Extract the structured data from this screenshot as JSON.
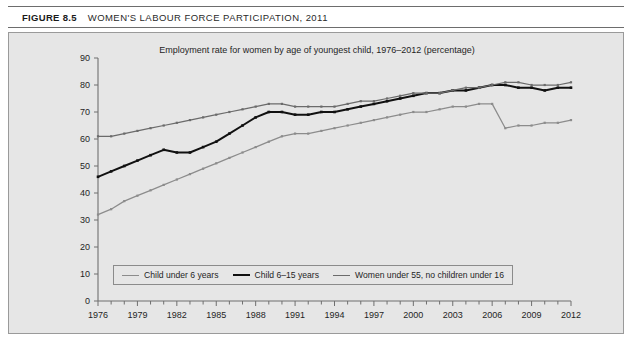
{
  "figure": {
    "number": "FIGURE 8.5",
    "title": "WOMEN'S LABOUR FORCE PARTICIPATION, 2011"
  },
  "chart_data": {
    "type": "line",
    "title": "Employment rate for women by age of youngest child, 1976–2012 (percentage)",
    "xlabel": "",
    "ylabel": "",
    "xlim": [
      1976,
      2012
    ],
    "ylim": [
      0,
      90
    ],
    "yticks": [
      0,
      10,
      20,
      30,
      40,
      50,
      60,
      70,
      80,
      90
    ],
    "xticks_labeled": [
      1976,
      1979,
      1982,
      1985,
      1988,
      1991,
      1994,
      1997,
      2000,
      2003,
      2006,
      2009,
      2012
    ],
    "xtick_interval_minor": 1,
    "grid": false,
    "legend_position": "inside-bottom-left",
    "markers": "square",
    "x": [
      1976,
      1977,
      1978,
      1979,
      1980,
      1981,
      1982,
      1983,
      1984,
      1985,
      1986,
      1987,
      1988,
      1989,
      1990,
      1991,
      1992,
      1993,
      1994,
      1995,
      1996,
      1997,
      1998,
      1999,
      2000,
      2001,
      2002,
      2003,
      2004,
      2005,
      2006,
      2007,
      2008,
      2009,
      2010,
      2011,
      2012
    ],
    "series": [
      {
        "name": "Child under 6 years",
        "color": "#8c8c8c",
        "values": [
          32,
          34,
          37,
          39,
          41,
          43,
          45,
          47,
          49,
          51,
          53,
          55,
          57,
          59,
          61,
          62,
          62,
          63,
          64,
          65,
          66,
          67,
          68,
          69,
          70,
          70,
          71,
          72,
          72,
          73,
          73,
          64,
          65,
          65,
          66,
          66,
          67
        ]
      },
      {
        "name": "Child 6–15 years",
        "color": "#111111",
        "values": [
          46,
          48,
          50,
          52,
          54,
          56,
          55,
          55,
          57,
          59,
          62,
          65,
          68,
          70,
          70,
          69,
          69,
          70,
          70,
          71,
          72,
          73,
          74,
          75,
          76,
          77,
          77,
          78,
          78,
          79,
          80,
          80,
          79,
          79,
          78,
          79,
          79
        ]
      },
      {
        "name": "Women under 55, no children under 16",
        "color": "#6b6b6b",
        "values": [
          61,
          61,
          62,
          63,
          64,
          65,
          66,
          67,
          68,
          69,
          70,
          71,
          72,
          73,
          73,
          72,
          72,
          72,
          72,
          73,
          74,
          74,
          75,
          76,
          77,
          77,
          77,
          78,
          79,
          79,
          80,
          81,
          81,
          80,
          80,
          80,
          81
        ]
      }
    ]
  },
  "legend": {
    "items": [
      {
        "label": "Child under 6 years"
      },
      {
        "label": "Child 6–15 years"
      },
      {
        "label": "Women under 55, no children under 16"
      }
    ]
  }
}
